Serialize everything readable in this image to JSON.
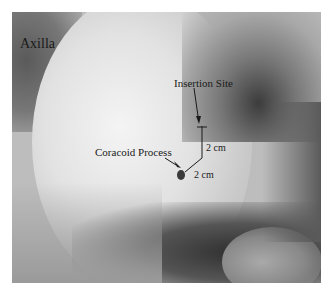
{
  "figure": {
    "type": "clinical photograph",
    "tone": "grayscale",
    "labels": {
      "region": "Axilla",
      "insertion": "Insertion Site",
      "landmark": "Coracoid Process",
      "vertical_measure": "2 cm",
      "horizontal_measure": "2 cm"
    },
    "colors": {
      "border": "#ffffff",
      "text": "#1a1a1a",
      "dark_shadow": "#2a2a2a",
      "highlight": "#f2f2f2"
    }
  }
}
